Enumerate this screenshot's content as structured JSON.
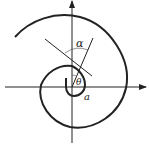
{
  "diagram": {
    "type": "spiral with axes",
    "labels": {
      "alpha": "α",
      "theta": "θ",
      "a": "a"
    },
    "colors": {
      "stroke": "#222222",
      "background": "#ffffff"
    }
  }
}
